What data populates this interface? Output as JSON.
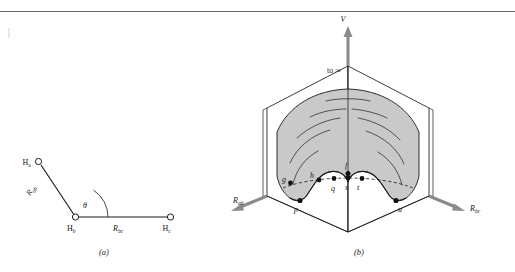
{
  "figure": {
    "top_rule": true,
    "background_color": "#ffffff",
    "line_color": "#1a1a1a",
    "surface_fill": "#c9c9c9",
    "axis_arrow_color": "#808080",
    "marker_color": "#111111"
  },
  "panel_a": {
    "caption": "(a)",
    "atoms": [
      {
        "id": "Ha",
        "label": "H",
        "sub": "a"
      },
      {
        "id": "Hb",
        "label": "H",
        "sub": "b"
      },
      {
        "id": "Hc",
        "label": "H",
        "sub": "c"
      }
    ],
    "bonds": [
      {
        "id": "Rab",
        "label": "R",
        "sub": "ab"
      },
      {
        "id": "Rbc",
        "label": "R",
        "sub": "bc"
      }
    ],
    "angle": {
      "id": "theta",
      "label": "θ"
    }
  },
  "panel_b": {
    "caption": "(b)",
    "vertical_axis": {
      "label": "V"
    },
    "left_axis": {
      "label": "R",
      "sub": "ab"
    },
    "right_axis": {
      "label": "R",
      "sub": "bc"
    },
    "to_infinity": {
      "label": "to ∞"
    },
    "points": [
      {
        "id": "g",
        "label": "g"
      },
      {
        "id": "h",
        "label": "h"
      },
      {
        "id": "p",
        "label": "p"
      },
      {
        "id": "q",
        "label": "q"
      },
      {
        "id": "s",
        "label": "s"
      },
      {
        "id": "t",
        "label": "t"
      },
      {
        "id": "f",
        "label": "f"
      },
      {
        "id": "u",
        "label": "u"
      }
    ]
  }
}
